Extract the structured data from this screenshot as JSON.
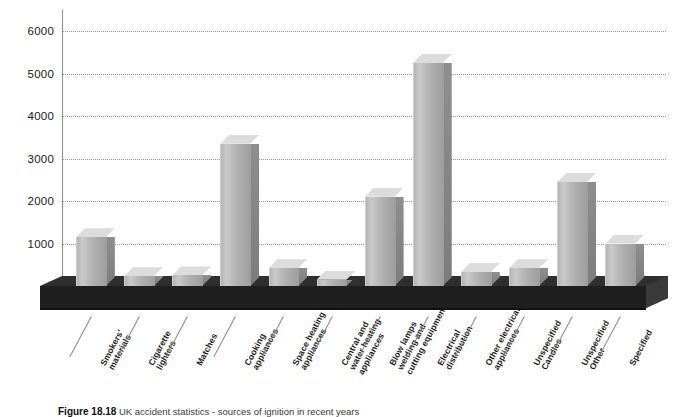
{
  "chart_data": {
    "type": "bar",
    "title": "UK accident statistics - sources of ignition in recent years",
    "xlabel": "",
    "ylabel": "",
    "ylim": [
      0,
      6000
    ],
    "grid": true,
    "legend": null,
    "style": "3d-column",
    "yticks": [
      "0",
      "1000",
      "2000",
      "3000",
      "4000",
      "5000",
      "6000"
    ],
    "ytick_values": [
      0,
      1000,
      2000,
      3000,
      4000,
      5000,
      6000
    ],
    "categories": [
      "Smokers'\nmaterials",
      "Cigarette\nlighters",
      "Matches",
      "Cooking\nappliances",
      "Space heating\nappliances",
      "Central and\nwater heating\nappliances",
      "Blow lamps\nwelding and\ncutting equipment",
      "Electrical\ndistribution",
      "Other electrical\nappliances",
      "Unspecified\nCandles",
      "Unspecified\nOther",
      "Specified"
    ],
    "values": [
      1150,
      230,
      250,
      3350,
      420,
      150,
      2100,
      5250,
      330,
      420,
      2450,
      1000
    ]
  },
  "caption": {
    "figure_number": "Figure 18.18",
    "text": "UK accident statistics - sources of ignition in recent years"
  },
  "colors": {
    "bar_front": "#b8b8b8",
    "bar_top": "#dcdcdc",
    "bar_side": "#868686",
    "floor_top": "#2b2b2b",
    "floor_front": "#1a1a1a",
    "grid": "#9a9a9a",
    "axis": "#8d8d8d",
    "text": "#1c1c1c",
    "background": "#ffffff"
  }
}
